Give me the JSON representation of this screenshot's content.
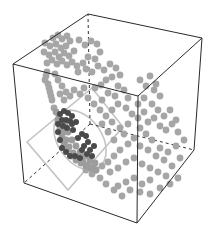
{
  "chart_data": {
    "type": "scatter",
    "subtype": "3d-scatter",
    "title": "",
    "xlabel": "",
    "ylabel": "",
    "zlabel": "",
    "axes_ticks": "none",
    "grid": false,
    "legend": null,
    "box": {
      "style": "wireframe cube, hidden edges dashed",
      "color": "#2a2a2a",
      "vertices_px": {
        "top_back_left": [
          88,
          14
        ],
        "top_back_right": [
          202,
          38
        ],
        "top_front_left": [
          13,
          64
        ],
        "top_front_right": [
          138,
          96
        ],
        "bottom_back_left": [
          90,
          124
        ],
        "bottom_back_right": [
          194,
          150
        ],
        "bottom_front_left": [
          24,
          183
        ],
        "bottom_front_right": [
          137,
          223
        ]
      }
    },
    "overlays": {
      "tilted_square": {
        "color": "#c4c4c4",
        "points_px": [
          [
            92,
            88
          ],
          [
            123,
            127
          ],
          [
            68,
            190
          ],
          [
            27,
            142
          ]
        ]
      },
      "ellipse": {
        "color": "#c4c4c4",
        "cx": 80,
        "cy": 140,
        "rx": 22,
        "ry": 33,
        "rotate": -35
      }
    },
    "series": [
      {
        "name": "background points",
        "color": "#a6a6a6",
        "radius": 3.4,
        "points_px": [
          [
            53,
            38
          ],
          [
            58,
            35
          ],
          [
            62,
            39
          ],
          [
            67,
            36
          ],
          [
            45,
            43
          ],
          [
            50,
            46
          ],
          [
            56,
            44
          ],
          [
            61,
            48
          ],
          [
            66,
            46
          ],
          [
            70,
            41
          ],
          [
            44,
            52
          ],
          [
            49,
            55
          ],
          [
            55,
            52
          ],
          [
            59,
            57
          ],
          [
            64,
            53
          ],
          [
            69,
            56
          ],
          [
            74,
            51
          ],
          [
            47,
            63
          ],
          [
            52,
            60
          ],
          [
            57,
            64
          ],
          [
            62,
            61
          ],
          [
            67,
            65
          ],
          [
            72,
            62
          ],
          [
            77,
            66
          ],
          [
            79,
            40
          ],
          [
            85,
            45
          ],
          [
            91,
            41
          ],
          [
            97,
            44
          ],
          [
            100,
            52
          ],
          [
            95,
            59
          ],
          [
            88,
            57
          ],
          [
            83,
            63
          ],
          [
            78,
            72
          ],
          [
            86,
            69
          ],
          [
            92,
            72
          ],
          [
            98,
            66
          ],
          [
            104,
            70
          ],
          [
            110,
            64
          ],
          [
            116,
            68
          ],
          [
            120,
            75
          ],
          [
            112,
            77
          ],
          [
            106,
            80
          ],
          [
            101,
            85
          ],
          [
            95,
            88
          ],
          [
            118,
            86
          ],
          [
            124,
            90
          ],
          [
            128,
            98
          ],
          [
            115,
            96
          ],
          [
            108,
            93
          ],
          [
            102,
            100
          ],
          [
            46,
            76
          ],
          [
            48,
            84
          ],
          [
            50,
            92
          ],
          [
            52,
            100
          ],
          [
            54,
            108
          ],
          [
            45,
            80
          ],
          [
            49,
            88
          ],
          [
            51,
            96
          ],
          [
            47,
            72
          ],
          [
            55,
            74
          ],
          [
            58,
            80
          ],
          [
            62,
            86
          ],
          [
            66,
            92
          ],
          [
            60,
            94
          ],
          [
            64,
            100
          ],
          [
            70,
            96
          ],
          [
            74,
            90
          ],
          [
            80,
            94
          ],
          [
            84,
            88
          ],
          [
            88,
            98
          ],
          [
            94,
            104
          ],
          [
            100,
            110
          ],
          [
            106,
            116
          ],
          [
            112,
            110
          ],
          [
            118,
            104
          ],
          [
            126,
            108
          ],
          [
            132,
            114
          ],
          [
            138,
            118
          ],
          [
            144,
            112
          ],
          [
            148,
            122
          ],
          [
            154,
            118
          ],
          [
            160,
            126
          ],
          [
            166,
            130
          ],
          [
            172,
            124
          ],
          [
            178,
            132
          ],
          [
            184,
            140
          ],
          [
            176,
            146
          ],
          [
            168,
            152
          ],
          [
            160,
            148
          ],
          [
            152,
            140
          ],
          [
            146,
            134
          ],
          [
            140,
            128
          ],
          [
            134,
            138
          ],
          [
            128,
            144
          ],
          [
            120,
            150
          ],
          [
            114,
            156
          ],
          [
            108,
            162
          ],
          [
            102,
            166
          ],
          [
            96,
            170
          ],
          [
            110,
            172
          ],
          [
            118,
            168
          ],
          [
            126,
            162
          ],
          [
            134,
            158
          ],
          [
            142,
            164
          ],
          [
            150,
            168
          ],
          [
            158,
            172
          ],
          [
            166,
            176
          ],
          [
            150,
            180
          ],
          [
            142,
            184
          ],
          [
            134,
            178
          ],
          [
            126,
            182
          ],
          [
            118,
            186
          ],
          [
            130,
            190
          ],
          [
            140,
            192
          ],
          [
            150,
            194
          ],
          [
            160,
            188
          ],
          [
            170,
            184
          ],
          [
            178,
            178
          ],
          [
            122,
            196
          ],
          [
            114,
            190
          ],
          [
            106,
            184
          ],
          [
            100,
            178
          ],
          [
            92,
            174
          ],
          [
            86,
            170
          ],
          [
            140,
            146
          ],
          [
            148,
            150
          ],
          [
            156,
            156
          ],
          [
            164,
            160
          ],
          [
            172,
            166
          ],
          [
            180,
            158
          ],
          [
            120,
            128
          ],
          [
            128,
            124
          ],
          [
            124,
            134
          ],
          [
            114,
            140
          ],
          [
            108,
            132
          ],
          [
            102,
            124
          ],
          [
            112,
            122
          ],
          [
            138,
            104
          ],
          [
            144,
            98
          ],
          [
            152,
            104
          ],
          [
            158,
            110
          ],
          [
            164,
            116
          ],
          [
            170,
            110
          ],
          [
            176,
            120
          ],
          [
            160,
            96
          ],
          [
            154,
            90
          ],
          [
            146,
            86
          ],
          [
            140,
            80
          ],
          [
            150,
            76
          ],
          [
            156,
            84
          ]
        ]
      },
      {
        "name": "mid-gray curved band",
        "color": "#9c9c9c",
        "radius": 3.4,
        "points_px": [
          [
            56,
            112
          ],
          [
            58,
            120
          ],
          [
            60,
            128
          ],
          [
            62,
            136
          ],
          [
            64,
            144
          ],
          [
            67,
            150
          ],
          [
            71,
            156
          ],
          [
            76,
            160
          ],
          [
            81,
            163
          ],
          [
            86,
            166
          ],
          [
            91,
            168
          ],
          [
            96,
            170
          ],
          [
            59,
            116
          ],
          [
            61,
            124
          ],
          [
            63,
            132
          ],
          [
            66,
            140
          ],
          [
            69,
            147
          ],
          [
            73,
            153
          ],
          [
            78,
            158
          ],
          [
            83,
            162
          ],
          [
            88,
            165
          ],
          [
            93,
            168
          ],
          [
            65,
            124
          ],
          [
            68,
            132
          ],
          [
            72,
            140
          ],
          [
            76,
            146
          ],
          [
            80,
            152
          ],
          [
            85,
            156
          ],
          [
            90,
            160
          ],
          [
            95,
            163
          ]
        ]
      },
      {
        "name": "dark cluster",
        "color": "#4a4a4a",
        "radius": 3.0,
        "points_px": [
          [
            60,
            114
          ],
          [
            64,
            111
          ],
          [
            68,
            113
          ],
          [
            72,
            116
          ],
          [
            70,
            121
          ],
          [
            66,
            120
          ],
          [
            62,
            120
          ],
          [
            58,
            124
          ],
          [
            58,
            132
          ],
          [
            60,
            140
          ],
          [
            62,
            148
          ],
          [
            66,
            152
          ],
          [
            70,
            156
          ],
          [
            75,
            156
          ],
          [
            63,
            126
          ],
          [
            67,
            128
          ],
          [
            72,
            124
          ],
          [
            76,
            122
          ],
          [
            73,
            130
          ],
          [
            78,
            138
          ],
          [
            82,
            134
          ],
          [
            86,
            136
          ],
          [
            88,
            142
          ],
          [
            84,
            146
          ],
          [
            90,
            150
          ],
          [
            94,
            146
          ],
          [
            92,
            156
          ],
          [
            87,
            154
          ],
          [
            82,
            150
          ],
          [
            80,
            158
          ]
        ]
      }
    ]
  }
}
